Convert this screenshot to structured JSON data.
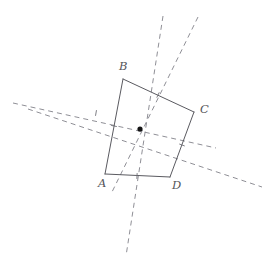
{
  "figure": {
    "canvas": {
      "width": 274,
      "height": 270,
      "background": "#ffffff"
    },
    "colors": {
      "solid_stroke": "#5a5a60",
      "dashed_stroke": "#8f8f96",
      "tick_stroke": "#6f6f76",
      "center_point": "#151515",
      "label_text": "#55555a"
    },
    "stroke_widths": {
      "solid": 1.0,
      "dashed": 1.0,
      "tick": 0.9
    },
    "dash_pattern": "5 4",
    "vertices": [
      {
        "name": "A",
        "label": "A",
        "x": 105,
        "y": 174,
        "label_x": 98,
        "label_y": 187
      },
      {
        "name": "B",
        "label": "B",
        "x": 123,
        "y": 79,
        "label_x": 119,
        "label_y": 70
      },
      {
        "name": "C",
        "label": "C",
        "x": 194,
        "y": 112,
        "label_x": 200,
        "label_y": 113
      },
      {
        "name": "D",
        "label": "D",
        "x": 170,
        "y": 177,
        "label_x": 172,
        "label_y": 189
      }
    ],
    "polygon_order": [
      "A",
      "B",
      "C",
      "D"
    ],
    "sides": [
      {
        "name": "side-AB",
        "from": "A",
        "to": "B"
      },
      {
        "name": "side-BC",
        "from": "B",
        "to": "C"
      },
      {
        "name": "side-CD",
        "from": "C",
        "to": "D"
      },
      {
        "name": "side-DA",
        "from": "D",
        "to": "A"
      }
    ],
    "center_point": {
      "name": "center",
      "x": 140,
      "y": 129,
      "radius": 2.6
    },
    "midpoint_ticks": [
      {
        "name": "tick-AB",
        "x": 114,
        "y": 126,
        "angle_deg": 11
      },
      {
        "name": "tick-BC",
        "x": 158,
        "y": 95,
        "angle_deg": 115
      },
      {
        "name": "tick-CD",
        "x": 182,
        "y": 145,
        "angle_deg": 20
      },
      {
        "name": "tick-DA",
        "x": 137,
        "y": 176,
        "angle_deg": 93
      },
      {
        "name": "tick-left-cross",
        "x": 96,
        "y": 113,
        "angle_deg": 100
      }
    ],
    "dashed_lines": [
      {
        "name": "dashed-axis-vertical",
        "x1": 163,
        "y1": 16,
        "x2": 126,
        "y2": 256
      },
      {
        "name": "dashed-axis-diagonal-up-right",
        "x1": 198,
        "y1": 17,
        "x2": 112,
        "y2": 192
      },
      {
        "name": "dashed-axis-horizontal",
        "x1": 13,
        "y1": 103,
        "x2": 216,
        "y2": 148
      },
      {
        "name": "dashed-axis-shallow",
        "x1": 28,
        "y1": 109,
        "x2": 262,
        "y2": 187
      }
    ]
  }
}
